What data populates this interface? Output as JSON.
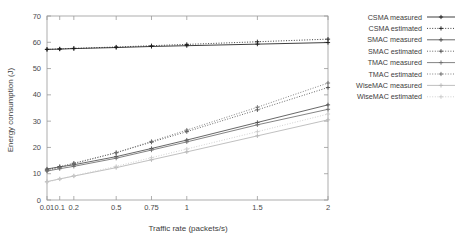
{
  "chart_data": {
    "type": "line",
    "title": "",
    "xlabel": "Traffic rate (packets/s)",
    "ylabel": "Energy consumption (J)",
    "x": [
      0.01,
      0.1,
      0.2,
      0.5,
      0.75,
      1,
      1.5,
      2
    ],
    "xtick_labels": [
      "0.01",
      "0.1",
      "0.2",
      "0.5",
      "0.75",
      "1",
      "1.5",
      "2"
    ],
    "ytick_labels": [
      "0",
      "10",
      "20",
      "30",
      "40",
      "50",
      "60",
      "70"
    ],
    "ytick_values": [
      0,
      10,
      20,
      30,
      40,
      50,
      60,
      70
    ],
    "xlim": [
      0.01,
      2
    ],
    "ylim": [
      0,
      70
    ],
    "grid": false,
    "legend_position": "right",
    "series": [
      {
        "name": "CSMA measured",
        "style": "solid",
        "marker": "plus",
        "color": "#1c1c1c",
        "values": [
          57.3,
          57.4,
          57.6,
          58.0,
          58.4,
          58.7,
          59.3,
          59.9
        ]
      },
      {
        "name": "CSMA estimated",
        "style": "dotted",
        "marker": "plus",
        "color": "#1c1c1c",
        "values": [
          57.3,
          57.5,
          57.7,
          58.2,
          58.7,
          59.2,
          60.2,
          61.2
        ]
      },
      {
        "name": "SMAC measured",
        "style": "solid",
        "marker": "plus",
        "color": "#4d4d4d",
        "values": [
          11.8,
          12.6,
          13.4,
          16.5,
          19.6,
          22.8,
          29.5,
          36.2
        ]
      },
      {
        "name": "SMAC estimated",
        "style": "dotted",
        "marker": "plus",
        "color": "#4d4d4d",
        "values": [
          11.5,
          12.7,
          14.0,
          18.0,
          22.0,
          26.0,
          34.3,
          42.8
        ]
      },
      {
        "name": "TMAC measured",
        "style": "solid",
        "marker": "plus",
        "color": "#6e6e6e",
        "values": [
          11.0,
          11.9,
          12.8,
          15.9,
          19.0,
          22.1,
          28.6,
          34.5
        ]
      },
      {
        "name": "TMAC estimated",
        "style": "dotted",
        "marker": "plus",
        "color": "#6e6e6e",
        "values": [
          11.2,
          12.4,
          13.8,
          18.0,
          22.3,
          26.6,
          35.3,
          44.5
        ]
      },
      {
        "name": "WiseMAC measured",
        "style": "solid",
        "marker": "plus",
        "color": "#b5b5b5",
        "values": [
          7.0,
          8.0,
          9.1,
          12.3,
          15.3,
          18.3,
          24.4,
          30.5
        ]
      },
      {
        "name": "WiseMAC estimated",
        "style": "dotted",
        "marker": "plus",
        "color": "#c9c9c9",
        "values": [
          6.8,
          8.0,
          9.2,
          12.8,
          16.1,
          19.4,
          26.0,
          32.7
        ]
      }
    ]
  }
}
